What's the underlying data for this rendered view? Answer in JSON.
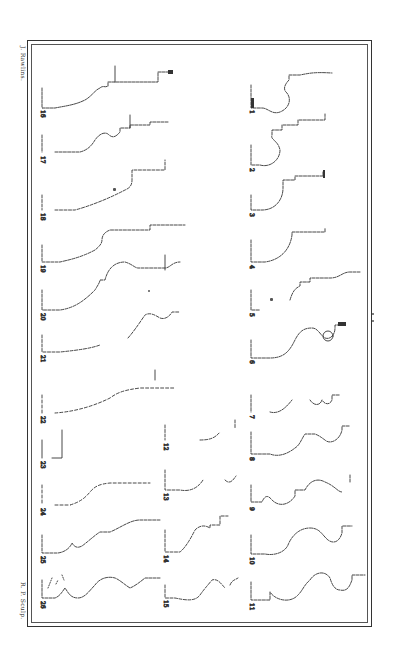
{
  "plate": {
    "title_left_top": "J. Rawlins.",
    "title_left_bottom": "R. P. Sculp.",
    "ink_color": "#333333",
    "paper_color": "#ffffff"
  },
  "columns": {
    "right": {
      "numbers": [
        "1",
        "2",
        "3",
        "4",
        "5",
        "6",
        "7",
        "8",
        "9",
        "10",
        "11"
      ]
    },
    "middle": {
      "numbers": [
        "12",
        "13",
        "14",
        "15"
      ]
    },
    "left": {
      "numbers": [
        "16",
        "17",
        "18",
        "19",
        "20",
        "21",
        "22",
        "23",
        "24",
        "25",
        "26"
      ]
    }
  },
  "profiles": [
    {
      "n": "1",
      "label": "1"
    },
    {
      "n": "2",
      "label": "2"
    },
    {
      "n": "3",
      "label": "3"
    },
    {
      "n": "4",
      "label": "4"
    },
    {
      "n": "5",
      "label": "5"
    },
    {
      "n": "6",
      "label": "6"
    },
    {
      "n": "7",
      "label": "7"
    },
    {
      "n": "8",
      "label": "8"
    },
    {
      "n": "9",
      "label": "9"
    },
    {
      "n": "10",
      "label": "10"
    },
    {
      "n": "11",
      "label": "11"
    },
    {
      "n": "12",
      "label": "12"
    },
    {
      "n": "13",
      "label": "13"
    },
    {
      "n": "14",
      "label": "14"
    },
    {
      "n": "15",
      "label": "15"
    },
    {
      "n": "16",
      "label": "16"
    },
    {
      "n": "17",
      "label": "17"
    },
    {
      "n": "18",
      "label": "18"
    },
    {
      "n": "19",
      "label": "19"
    },
    {
      "n": "20",
      "label": "20"
    },
    {
      "n": "21",
      "label": "21"
    },
    {
      "n": "22",
      "label": "22"
    },
    {
      "n": "23",
      "label": "23"
    },
    {
      "n": "24",
      "label": "24"
    },
    {
      "n": "25",
      "label": "25"
    },
    {
      "n": "26",
      "label": "26"
    }
  ]
}
